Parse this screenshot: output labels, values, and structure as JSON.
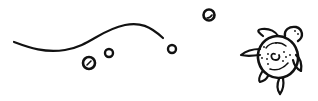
{
  "illustration": {
    "subject": "sea turtle swimming with bubbles and wave line",
    "stroke_color": "#111111",
    "background": "#ffffff",
    "elements": [
      {
        "name": "wave-line"
      },
      {
        "name": "bubble",
        "count": 5
      },
      {
        "name": "turtle"
      }
    ]
  }
}
